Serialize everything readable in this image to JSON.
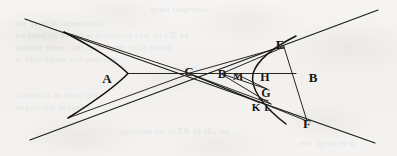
{
  "figure": {
    "ink_color": "#16150f",
    "paper_color": "#f4f3f1",
    "width": 397,
    "height": 156
  },
  "labels": [
    {
      "id": "A",
      "text": "A",
      "x": 107,
      "y": 78,
      "size": 13,
      "desc": "left-branch-region-label"
    },
    {
      "id": "C",
      "text": "C",
      "x": 189,
      "y": 71,
      "size": 13,
      "desc": "center-point-label"
    },
    {
      "id": "D",
      "text": "D",
      "x": 222,
      "y": 74,
      "size": 12,
      "desc": "axis-point-label"
    },
    {
      "id": "M",
      "text": "M",
      "x": 238,
      "y": 76,
      "size": 11,
      "desc": "axis-point-label"
    },
    {
      "id": "E",
      "text": "E",
      "x": 280,
      "y": 44,
      "size": 13,
      "desc": "upper-point-label"
    },
    {
      "id": "H",
      "text": "H",
      "x": 265,
      "y": 77,
      "size": 12,
      "desc": "ordinate-point-label"
    },
    {
      "id": "B",
      "text": "B",
      "x": 313,
      "y": 77,
      "size": 13,
      "desc": "right-branch-region-label"
    },
    {
      "id": "G",
      "text": "G",
      "x": 266,
      "y": 93,
      "size": 12,
      "desc": "lower-point-label"
    },
    {
      "id": "K",
      "text": "K",
      "x": 256,
      "y": 107,
      "size": 11,
      "desc": "lower-point-label"
    },
    {
      "id": "L",
      "text": "L",
      "x": 268,
      "y": 107,
      "size": 11,
      "desc": "lower-point-label"
    },
    {
      "id": "F",
      "text": "F",
      "x": 307,
      "y": 123,
      "size": 13,
      "desc": "lower-right-point-label"
    }
  ],
  "chart_data": {
    "type": "diagram",
    "center": {
      "x": 190,
      "y": 73.5
    },
    "asymptotes": [
      {
        "name": "asymptote-upper-left-to-lower-right",
        "x1": 25,
        "y1": 19,
        "x2": 375,
        "y2": 143
      },
      {
        "name": "asymptote-lower-left-to-upper-right",
        "x1": 30,
        "y1": 140,
        "x2": 378,
        "y2": 10
      }
    ],
    "branches": [
      {
        "name": "left-branch",
        "vertex": {
          "x": 128,
          "y": 73.5
        },
        "path": "M 64,32 C 92,47 115,60 128,73.5 C 115,87 95,101 68,118"
      },
      {
        "name": "right-branch",
        "vertex": {
          "x": 253,
          "y": 73.5
        },
        "path": "M 296,36 C 272,48 257,61 253,73.5 C 250,88 262,106 286,124"
      }
    ],
    "segments": [
      {
        "name": "axis-vertex-to-center",
        "x1": 128,
        "y1": 73.5,
        "x2": 190,
        "y2": 73.5
      },
      {
        "name": "axis-center-to-H",
        "x1": 190,
        "y1": 73.5,
        "x2": 296,
        "y2": 73.5
      },
      {
        "name": "chord-C-to-E",
        "x1": 190,
        "y1": 73.5,
        "x2": 283,
        "y2": 47
      },
      {
        "name": "chord-C-to-F",
        "x1": 190,
        "y1": 73.5,
        "x2": 306,
        "y2": 121
      },
      {
        "name": "chord-C-to-L",
        "x1": 190,
        "y1": 73.5,
        "x2": 270,
        "y2": 103
      },
      {
        "name": "chord-C-to-K",
        "x1": 190,
        "y1": 73.5,
        "x2": 259,
        "y2": 102
      },
      {
        "name": "segment-E-to-F",
        "x1": 283,
        "y1": 47,
        "x2": 306,
        "y2": 121
      },
      {
        "name": "segment-E-to-D",
        "x1": 283,
        "y1": 47,
        "x2": 223,
        "y2": 73.5
      },
      {
        "name": "segment-D-to-G",
        "x1": 223,
        "y1": 73.5,
        "x2": 266,
        "y2": 89
      },
      {
        "name": "segment-D-to-L",
        "x1": 223,
        "y1": 73.5,
        "x2": 270,
        "y2": 103
      },
      {
        "name": "segment-M-to-G",
        "x1": 236,
        "y1": 73.5,
        "x2": 266,
        "y2": 89
      },
      {
        "name": "segment-tangent-upper",
        "x1": 64,
        "y1": 32,
        "x2": 190,
        "y2": 73.5
      },
      {
        "name": "segment-tangent-lower",
        "x1": 68,
        "y1": 118,
        "x2": 190,
        "y2": 73.5
      }
    ],
    "points": [
      {
        "label": "A",
        "role": "left-branch-region",
        "x": 107,
        "y": 78
      },
      {
        "label": "C",
        "role": "center",
        "x": 190,
        "y": 73.5
      },
      {
        "label": "D",
        "role": "on-axis",
        "x": 223,
        "y": 73.5
      },
      {
        "label": "M",
        "role": "on-axis",
        "x": 236,
        "y": 73.5
      },
      {
        "label": "E",
        "role": "on-curve-upper",
        "x": 283,
        "y": 47
      },
      {
        "label": "H",
        "role": "on-curve-axis",
        "x": 260,
        "y": 73.5
      },
      {
        "label": "B",
        "role": "right-branch-region",
        "x": 313,
        "y": 76
      },
      {
        "label": "G",
        "role": "on-curve-lower",
        "x": 266,
        "y": 89
      },
      {
        "label": "K",
        "role": "below-G",
        "x": 259,
        "y": 102
      },
      {
        "label": "L",
        "role": "below-G",
        "x": 270,
        "y": 103
      },
      {
        "label": "F",
        "role": "on-curve-lower-right",
        "x": 306,
        "y": 121
      }
    ]
  },
  "ghost_text": {
    "lines": [
      {
        "text": "quasi tangentes",
        "x": 150,
        "y": 4
      },
      {
        "text": "tur quod in consectario",
        "x": 16,
        "y": 18
      },
      {
        "text": "eo quod sit datum ac propterea cum sit CD ad",
        "x": 16,
        "y": 30
      },
      {
        "text": "quoque datae sunt ac proinde ratio earum",
        "x": 16,
        "y": 42
      },
      {
        "text": "et ideo datum erit punctum",
        "x": 16,
        "y": 54
      },
      {
        "text": "si non sit in recta ipsi",
        "x": 16,
        "y": 90
      },
      {
        "text": "anguli sint aequales",
        "x": 16,
        "y": 102
      },
      {
        "text": "quoniam est ut EH ad HG ita",
        "x": 120,
        "y": 126
      },
      {
        "text": "erit igitur et ut",
        "x": 300,
        "y": 138
      }
    ]
  }
}
